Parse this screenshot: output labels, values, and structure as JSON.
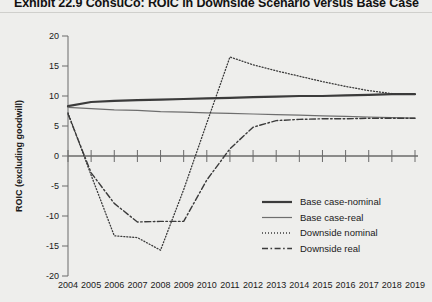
{
  "title": "Exhibit 22.9 ConsuCo: ROIC in Downside Scenario versus Base Case",
  "chart_data": {
    "type": "line",
    "title": "Exhibit 22.9 ConsuCo: ROIC in Downside Scenario versus Base Case",
    "xlabel": "",
    "ylabel": "ROIC (excluding goodwill)",
    "grid": false,
    "legend_position": "center-right",
    "xlim": [
      2004,
      2019
    ],
    "ylim": [
      -20,
      20
    ],
    "ytick_labels": [
      "20",
      "15",
      "10",
      "5",
      "0",
      "-5",
      "-10",
      "-15",
      "-20"
    ],
    "yticks": [
      20,
      15,
      10,
      5,
      0,
      -5,
      -10,
      -15,
      -20
    ],
    "categories": [
      2004,
      2005,
      2006,
      2007,
      2008,
      2009,
      2010,
      2011,
      2012,
      2013,
      2014,
      2015,
      2016,
      2017,
      2018,
      2019
    ],
    "xtick_labels": [
      "2004",
      "2005",
      "2006",
      "2007",
      "2008",
      "2009",
      "2010",
      "2011",
      "2012",
      "2013",
      "2014",
      "2015",
      "2016",
      "2017",
      "2018",
      "2019"
    ],
    "series": [
      {
        "name": "Base case-nominal",
        "style": "solid-thick",
        "color": "#3b3b3b",
        "values": [
          8.3,
          9.0,
          9.2,
          9.3,
          9.4,
          9.5,
          9.6,
          9.7,
          9.8,
          9.9,
          10.0,
          10.0,
          10.1,
          10.2,
          10.3,
          10.3
        ]
      },
      {
        "name": "Base case-real",
        "style": "solid-thin",
        "color": "#6e6e6e",
        "values": [
          8.1,
          7.9,
          7.7,
          7.6,
          7.4,
          7.3,
          7.2,
          7.1,
          7.0,
          6.9,
          6.8,
          6.7,
          6.6,
          6.5,
          6.4,
          6.3
        ]
      },
      {
        "name": "Downside nominal",
        "style": "dotted",
        "color": "#3b3b3b",
        "values": [
          7.2,
          -3.2,
          -13.3,
          -13.6,
          -15.7,
          -5.6,
          5.5,
          16.5,
          15.2,
          14.2,
          13.3,
          12.4,
          11.6,
          10.9,
          10.4,
          10.3
        ]
      },
      {
        "name": "Downside real",
        "style": "dash-dot",
        "color": "#3b3b3b",
        "values": [
          7.0,
          -2.8,
          -7.9,
          -11.0,
          -10.9,
          -10.9,
          -4.0,
          1.2,
          4.8,
          5.9,
          6.1,
          6.2,
          6.2,
          6.3,
          6.3,
          6.3
        ]
      }
    ]
  },
  "legend": {
    "items": [
      {
        "label": "Base case-nominal",
        "style": "solid-thick"
      },
      {
        "label": "Base case-real",
        "style": "solid-thin"
      },
      {
        "label": "Downside nominal",
        "style": "dotted"
      },
      {
        "label": "Downside real",
        "style": "dash-dot"
      }
    ]
  }
}
